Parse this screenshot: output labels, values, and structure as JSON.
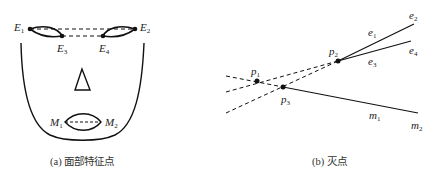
{
  "panel_a": {
    "caption": "(a) 面部特征点",
    "labels": {
      "E1": {
        "base": "E",
        "sub": "1"
      },
      "E2": {
        "base": "E",
        "sub": "2"
      },
      "E3": {
        "base": "E",
        "sub": "3"
      },
      "E4": {
        "base": "E",
        "sub": "4"
      },
      "M1": {
        "base": "M",
        "sub": "1"
      },
      "M2": {
        "base": "M",
        "sub": "2"
      }
    }
  },
  "panel_b": {
    "caption": "(b) 灭点",
    "labels": {
      "p1": {
        "base": "p",
        "sub": "1"
      },
      "p2": {
        "base": "p",
        "sub": "2"
      },
      "p3": {
        "base": "p",
        "sub": "3"
      },
      "e1": {
        "base": "e",
        "sub": "1"
      },
      "e2": {
        "base": "e",
        "sub": "2"
      },
      "e3": {
        "base": "e",
        "sub": "3"
      },
      "e4": {
        "base": "e",
        "sub": "4"
      },
      "m1": {
        "base": "m",
        "sub": "1"
      },
      "m2": {
        "base": "m",
        "sub": "2"
      }
    }
  },
  "colors": {
    "stroke": "#111111",
    "background": "#ffffff"
  }
}
